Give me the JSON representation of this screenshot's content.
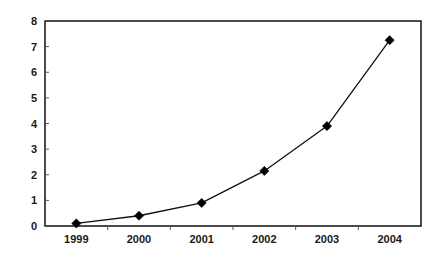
{
  "chart_data": {
    "type": "line",
    "title": "",
    "subtitle": "",
    "xlabel": "",
    "ylabel": "",
    "categories": [
      "1999",
      "2000",
      "2001",
      "2002",
      "2003",
      "2004"
    ],
    "values": [
      0.1,
      0.4,
      0.9,
      2.15,
      3.9,
      7.25
    ],
    "series": [
      {
        "name": "",
        "values": [
          0.1,
          0.4,
          0.9,
          2.15,
          3.9,
          7.25
        ]
      }
    ],
    "ylim": [
      0,
      8
    ],
    "y_ticks": [
      "0",
      "1",
      "2",
      "3",
      "4",
      "5",
      "6",
      "7",
      "8"
    ],
    "x_ticks": [
      "1999",
      "2000",
      "2001",
      "2002",
      "2003",
      "2004"
    ],
    "grid": false,
    "legend": false,
    "legend_position": "none",
    "annotations": [],
    "colors": {
      "line": "#111111",
      "marker": "#000000",
      "axis": "#000000",
      "tick_label": "#1a1a1a",
      "background": "#ffffff"
    },
    "marker_style": "diamond"
  }
}
